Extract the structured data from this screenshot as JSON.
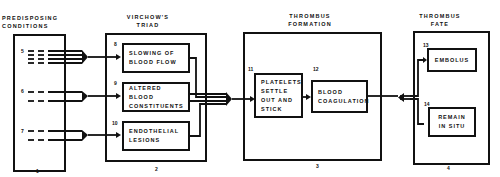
{
  "columns": {
    "predisposing": {
      "title_line1": "PREDISPOSING",
      "title_line2": "CONDITIONS",
      "footer": "1"
    },
    "virchow": {
      "title_line1": "VIRCHOW'S",
      "title_line2": "TRIAD",
      "footer": "2"
    },
    "formation": {
      "title_line1": "THROMBUS",
      "title_line2": "FORMATION",
      "footer": "3"
    },
    "fate": {
      "title_line1": "THROMBUS",
      "title_line2": "FATE",
      "footer": "4"
    }
  },
  "predisposing_groups": [
    {
      "number": "5"
    },
    {
      "number": "6"
    },
    {
      "number": "7"
    }
  ],
  "triad": [
    {
      "number": "8",
      "line1": "SLOWING OF",
      "line2": "BLOOD FLOW"
    },
    {
      "number": "9",
      "line1": "ALTERED BLOOD",
      "line2": "CONSTITUENTS"
    },
    {
      "number": "10",
      "line1": "ENDOTHELIAL",
      "line2": "LESIONS"
    }
  ],
  "formation_steps": [
    {
      "number": "11",
      "line1": "PLATELETS",
      "line2": "SETTLE",
      "line3": "OUT AND",
      "line4": "STICK"
    },
    {
      "number": "12",
      "line1": "BLOOD",
      "line2": "COAGULATION"
    }
  ],
  "fate": [
    {
      "number": "13",
      "line1": "EMBOLUS"
    },
    {
      "number": "14",
      "line1": "REMAIN",
      "line2": "IN SITU"
    }
  ]
}
